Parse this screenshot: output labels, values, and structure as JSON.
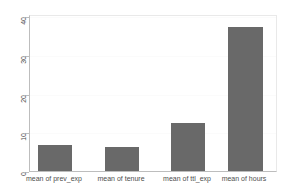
{
  "chart_data": {
    "type": "bar",
    "title": "",
    "subtitle": "",
    "xlabel": "",
    "ylabel": "",
    "categories": [
      "mean of prev_exp",
      "mean of tenure",
      "mean of ttl_exp",
      "mean of hours"
    ],
    "values": [
      6.6,
      6.1,
      12.5,
      37.2
    ],
    "ylim": [
      0,
      40
    ],
    "yticks": [
      0,
      10,
      20,
      30,
      40
    ],
    "ytick_labels": [
      "0",
      "10",
      "20",
      "30",
      "40"
    ],
    "grid": true,
    "legend": "none",
    "bar_color": "#696969",
    "axis_color": "#bdbdbd",
    "grid_color": "#fbfbfb",
    "background": "#ffffff"
  },
  "axes": {
    "y": {
      "ticks": [
        {
          "label": "40",
          "value": 40
        },
        {
          "label": "30",
          "value": 30
        },
        {
          "label": "20",
          "value": 20
        },
        {
          "label": "10",
          "value": 10
        },
        {
          "label": "0",
          "value": 0
        }
      ]
    },
    "x": {
      "ticks": [
        {
          "label": "mean of prev_exp"
        },
        {
          "label": "mean of tenure"
        },
        {
          "label": "mean of ttl_exp"
        },
        {
          "label": "mean of hours"
        }
      ]
    }
  }
}
